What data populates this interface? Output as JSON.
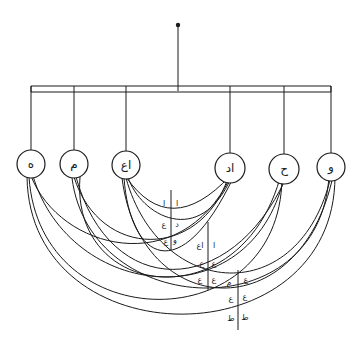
{
  "diagram": {
    "type": "hanging tree with interconnecting arcs",
    "root": {
      "label": ""
    },
    "nodes": [
      {
        "id": "n1",
        "label": "ه"
      },
      {
        "id": "n2",
        "label": "م"
      },
      {
        "id": "n3",
        "label": "اع"
      },
      {
        "id": "n4",
        "label": "اد"
      },
      {
        "id": "n5",
        "label": "ح"
      },
      {
        "id": "n6",
        "label": "و"
      }
    ],
    "tables": [
      {
        "id": "t1",
        "rows": [
          [
            "ا",
            "ا"
          ],
          [
            "ع",
            "د"
          ],
          [
            "ع",
            "و"
          ]
        ]
      },
      {
        "id": "t2",
        "rows": [
          [
            "اع",
            "ا"
          ],
          [
            "ع",
            "ع"
          ],
          [
            "ع",
            "ع"
          ]
        ]
      },
      {
        "id": "t3",
        "rows": [
          [
            "ع",
            "م"
          ],
          [
            "ع",
            "ع"
          ],
          [
            "ط",
            "ط"
          ]
        ]
      }
    ]
  },
  "colors": {
    "ink": "#1a1a1a",
    "background": "#ffffff"
  }
}
